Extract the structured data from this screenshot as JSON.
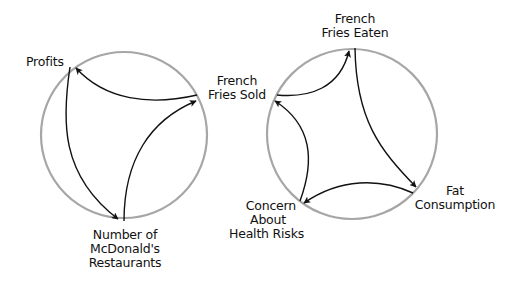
{
  "diagram": {
    "colors": {
      "circle": "#a6a6a6",
      "arrow": "#111111",
      "text": "#111111",
      "background": "#ffffff"
    },
    "loops": [
      {
        "id": "reinforcing-loop",
        "nodes": [
          {
            "id": "profits",
            "lines": [
              "Profits"
            ]
          },
          {
            "id": "restaurants",
            "lines": [
              "Number of",
              "McDonald's",
              "Restaurants"
            ]
          },
          {
            "id": "fries-sold",
            "lines": [
              "French",
              "Fries Sold"
            ]
          }
        ],
        "links": [
          {
            "from": "profits",
            "to": "restaurants"
          },
          {
            "from": "restaurants",
            "to": "fries-sold"
          },
          {
            "from": "fries-sold",
            "to": "profits"
          }
        ]
      },
      {
        "id": "balancing-loop",
        "nodes": [
          {
            "id": "fries-eaten",
            "lines": [
              "French",
              "Fries Eaten"
            ]
          },
          {
            "id": "fat-consumption",
            "lines": [
              "Fat",
              "Consumption"
            ]
          },
          {
            "id": "health-concern",
            "lines": [
              "Concern",
              "About",
              "Health Risks"
            ]
          },
          {
            "id": "fries-sold",
            "lines": [
              "French",
              "Fries Sold"
            ]
          }
        ],
        "links": [
          {
            "from": "fries-sold",
            "to": "fries-eaten"
          },
          {
            "from": "fries-eaten",
            "to": "fat-consumption"
          },
          {
            "from": "fat-consumption",
            "to": "health-concern"
          },
          {
            "from": "health-concern",
            "to": "fries-sold"
          }
        ]
      }
    ]
  },
  "labels": {
    "profits": "Profits",
    "restaurants_1": "Number of",
    "restaurants_2": "McDonald's",
    "restaurants_3": "Restaurants",
    "fries_sold_1": "French",
    "fries_sold_2": "Fries Sold",
    "fries_eaten_1": "French",
    "fries_eaten_2": "Fries Eaten",
    "fat_1": "Fat",
    "fat_2": "Consumption",
    "concern_1": "Concern",
    "concern_2": "About",
    "concern_3": "Health Risks"
  }
}
